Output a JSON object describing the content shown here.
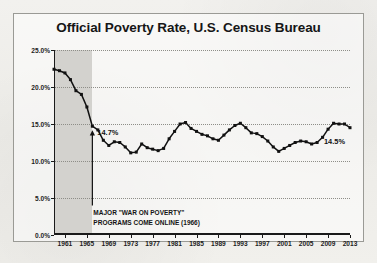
{
  "chart_data": {
    "type": "line",
    "title": "Official Poverty Rate, U.S. Census Bureau",
    "xlabel": "",
    "ylabel": "",
    "ylim": [
      0,
      25
    ],
    "xlim": [
      1959,
      2013
    ],
    "grid": true,
    "legend": null,
    "y_tick_labels": [
      "25.0%",
      "20.0%",
      "15.0%",
      "10.0%",
      "5.0%",
      "0.0%"
    ],
    "y_tick_values": [
      25,
      20,
      15,
      10,
      5,
      0
    ],
    "x_tick_labels": [
      "1961",
      "1965",
      "1969",
      "1973",
      "1977",
      "1981",
      "1985",
      "1989",
      "1993",
      "1997",
      "2001",
      "2005",
      "2009",
      "2013"
    ],
    "x_tick_values": [
      1961,
      1965,
      1969,
      1973,
      1977,
      1981,
      1985,
      1989,
      1993,
      1997,
      2001,
      2005,
      2009,
      2013
    ],
    "series": [
      {
        "name": "Official Poverty Rate",
        "x": [
          1959,
          1960,
          1961,
          1962,
          1963,
          1964,
          1965,
          1966,
          1967,
          1968,
          1969,
          1970,
          1971,
          1972,
          1973,
          1974,
          1975,
          1976,
          1977,
          1978,
          1979,
          1980,
          1981,
          1982,
          1983,
          1984,
          1985,
          1986,
          1987,
          1988,
          1989,
          1990,
          1991,
          1992,
          1993,
          1994,
          1995,
          1996,
          1997,
          1998,
          1999,
          2000,
          2001,
          2002,
          2003,
          2004,
          2005,
          2006,
          2007,
          2008,
          2009,
          2010,
          2011,
          2012,
          2013
        ],
        "values": [
          22.4,
          22.2,
          21.9,
          21.0,
          19.5,
          19.0,
          17.3,
          14.7,
          14.2,
          12.8,
          12.1,
          12.6,
          12.5,
          11.9,
          11.1,
          11.2,
          12.3,
          11.8,
          11.6,
          11.4,
          11.7,
          13.0,
          14.0,
          15.0,
          15.2,
          14.4,
          14.0,
          13.6,
          13.4,
          13.0,
          12.8,
          13.5,
          14.2,
          14.8,
          15.1,
          14.5,
          13.8,
          13.7,
          13.3,
          12.7,
          11.9,
          11.3,
          11.7,
          12.1,
          12.5,
          12.7,
          12.6,
          12.3,
          12.5,
          13.2,
          14.3,
          15.1,
          15.0,
          15.0,
          14.5
        ]
      }
    ],
    "point_labels": [
      {
        "x": 1966,
        "y": 14.7,
        "text": "14.7%"
      },
      {
        "x": 2013,
        "y": 14.5,
        "text": "14.5%"
      }
    ],
    "annotations": [
      {
        "name": "war-on-poverty",
        "at_x": 1966,
        "line1": "MAJOR \"WAR ON POVERTY\"",
        "line2": "PROGRAMS COME ONLINE (1966)"
      }
    ],
    "shaded_region": {
      "from": 1959,
      "to": 1966
    },
    "colors": {
      "line": "#111111",
      "marker": "#111111",
      "shade": "#d3d2ce",
      "grid": "#8e8e88",
      "axis": "#1a1a1a",
      "panel_border": "#9a9a95",
      "background": "#f0efeb"
    }
  }
}
